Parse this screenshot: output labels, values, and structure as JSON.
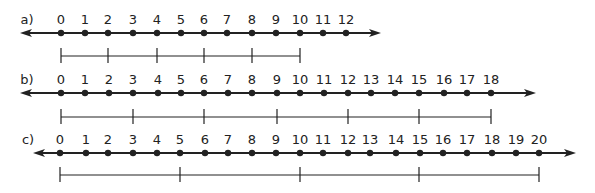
{
  "colors": {
    "ink": "#222222",
    "background": "#ffffff"
  },
  "number_lines": [
    {
      "label": "a)",
      "label_x": 27,
      "axis_y": 33,
      "label_y": 24,
      "arrow_left": 20,
      "arrow_right": 381,
      "ticks": [
        {
          "n": "0",
          "x": 61
        },
        {
          "n": "1",
          "x": 85
        },
        {
          "n": "2",
          "x": 108
        },
        {
          "n": "3",
          "x": 133
        },
        {
          "n": "4",
          "x": 157
        },
        {
          "n": "5",
          "x": 181
        },
        {
          "n": "6",
          "x": 204
        },
        {
          "n": "7",
          "x": 227
        },
        {
          "n": "8",
          "x": 252
        },
        {
          "n": "9",
          "x": 276
        },
        {
          "n": "10",
          "x": 300
        },
        {
          "n": "11",
          "x": 323
        },
        {
          "n": "12",
          "x": 346
        }
      ],
      "scale": {
        "y": 56,
        "x_start": 61,
        "x_end": 300,
        "marks": [
          61,
          108,
          157,
          204,
          252,
          300
        ],
        "step": 2
      }
    },
    {
      "label": "b)",
      "label_x": 27,
      "axis_y": 93,
      "label_y": 84,
      "arrow_left": 20,
      "arrow_right": 536,
      "ticks": [
        {
          "n": "0",
          "x": 61
        },
        {
          "n": "1",
          "x": 85
        },
        {
          "n": "2",
          "x": 109
        },
        {
          "n": "3",
          "x": 133
        },
        {
          "n": "4",
          "x": 158
        },
        {
          "n": "5",
          "x": 181
        },
        {
          "n": "6",
          "x": 204
        },
        {
          "n": "7",
          "x": 228
        },
        {
          "n": "8",
          "x": 252
        },
        {
          "n": "9",
          "x": 277
        },
        {
          "n": "10",
          "x": 300
        },
        {
          "n": "11",
          "x": 324
        },
        {
          "n": "12",
          "x": 348
        },
        {
          "n": "13",
          "x": 371
        },
        {
          "n": "14",
          "x": 395
        },
        {
          "n": "15",
          "x": 419
        },
        {
          "n": "16",
          "x": 444
        },
        {
          "n": "17",
          "x": 467
        },
        {
          "n": "18",
          "x": 491
        }
      ],
      "scale": {
        "y": 117,
        "x_start": 61,
        "x_end": 491,
        "marks": [
          61,
          133,
          204,
          277,
          348,
          419,
          491
        ],
        "step": 3
      }
    },
    {
      "label": "c)",
      "label_x": 28,
      "axis_y": 153,
      "label_y": 144,
      "arrow_left": 33,
      "arrow_right": 576,
      "ticks": [
        {
          "n": "0",
          "x": 60
        },
        {
          "n": "1",
          "x": 86
        },
        {
          "n": "2",
          "x": 108
        },
        {
          "n": "3",
          "x": 133
        },
        {
          "n": "4",
          "x": 157
        },
        {
          "n": "5",
          "x": 180
        },
        {
          "n": "6",
          "x": 205
        },
        {
          "n": "7",
          "x": 228
        },
        {
          "n": "8",
          "x": 252
        },
        {
          "n": "9",
          "x": 276
        },
        {
          "n": "10",
          "x": 300
        },
        {
          "n": "11",
          "x": 323
        },
        {
          "n": "12",
          "x": 348
        },
        {
          "n": "13",
          "x": 370
        },
        {
          "n": "14",
          "x": 396
        },
        {
          "n": "15",
          "x": 420
        },
        {
          "n": "16",
          "x": 443
        },
        {
          "n": "17",
          "x": 467
        },
        {
          "n": "18",
          "x": 492
        },
        {
          "n": "19",
          "x": 516
        },
        {
          "n": "20",
          "x": 539
        }
      ],
      "scale": {
        "y": 175,
        "x_start": 60,
        "x_end": 539,
        "marks": [
          60,
          180,
          300,
          419,
          539
        ],
        "step": 5
      }
    }
  ]
}
